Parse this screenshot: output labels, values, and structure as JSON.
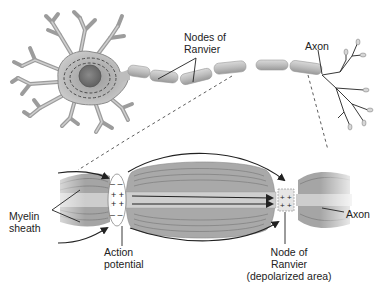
{
  "diagram": {
    "type": "labeled biological illustration"
  },
  "labels": {
    "nodes_of_ranvier": [
      "Nodes of",
      "Ranvier"
    ],
    "axon_top": "Axon",
    "myelin_sheath": [
      "Myelin",
      "sheath"
    ],
    "action_potential": [
      "Action",
      "potential"
    ],
    "node_of_ranvier": [
      "Node of",
      "Ranvier",
      "(depolarized area)"
    ],
    "axon_bottom": "Axon"
  },
  "charges": {
    "action_potential_inside": "+ +",
    "action_potential_outside": "– –",
    "node_inside": "+ +"
  },
  "colors": {
    "myelin": "#a9a9a9",
    "myelin_dark": "#7e7e7e",
    "axon_core": "#c9c9c9",
    "neuron_body": "#b8b8b8",
    "line": "#222222",
    "background": "#ffffff"
  }
}
